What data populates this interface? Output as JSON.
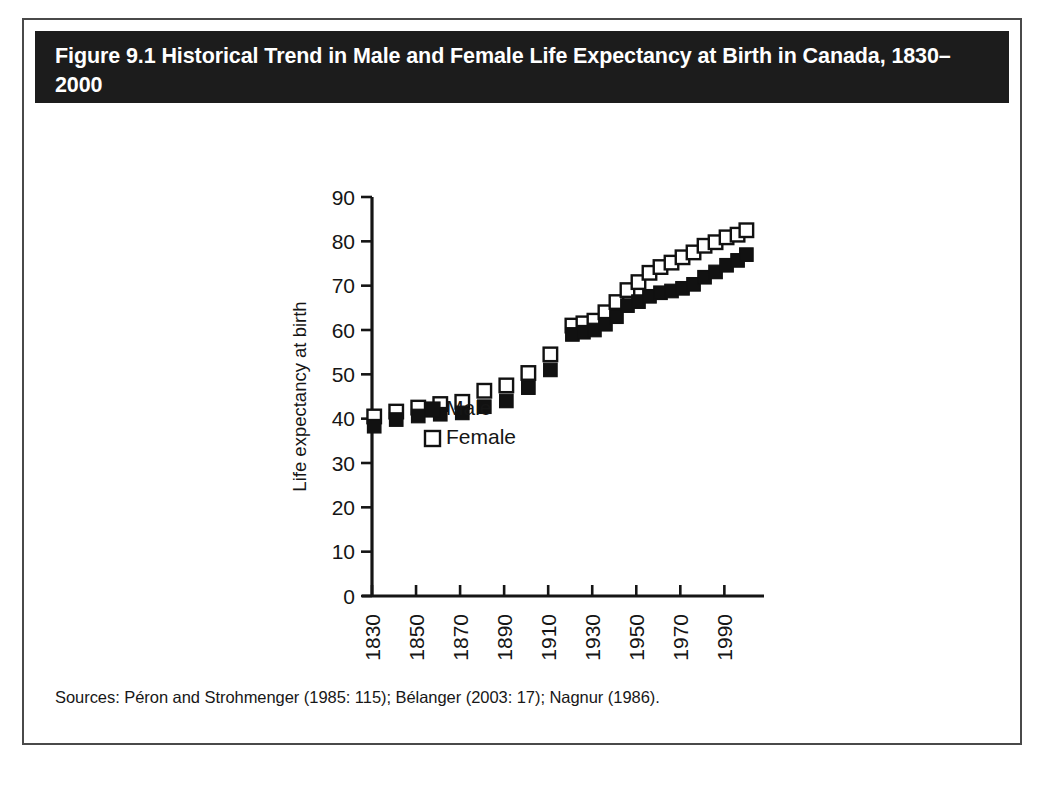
{
  "figure": {
    "title": "Figure 9.1 Historical Trend in Male and Female Life Expectancy at Birth in Canada, 1830–2000",
    "sources": "Sources: Péron and Strohmenger (1985: 115); Bélanger (2003: 17); Nagnur (1986).",
    "title_background": "#1c1c1c",
    "title_color": "#ffffff",
    "border_color": "#4a4a4a",
    "background": "#ffffff"
  },
  "chart_data": {
    "type": "scatter",
    "title": "Figure 9.1 Historical Trend in Male and Female Life Expectancy at Birth in Canada, 1830–2000",
    "xlabel": "",
    "ylabel": "Life expectancy at birth",
    "xlim": [
      1825,
      2005
    ],
    "ylim": [
      0,
      90
    ],
    "yticks": [
      0,
      10,
      20,
      30,
      40,
      50,
      60,
      70,
      80,
      90
    ],
    "xticks": [
      1830,
      1850,
      1870,
      1890,
      1910,
      1930,
      1950,
      1970,
      1990
    ],
    "xtick_rotation": 90,
    "grid": false,
    "legend_position": "inside-lower-left",
    "marker_male": "filled-square",
    "marker_female": "open-square",
    "color_male": "#111111",
    "color_female": "#ffffff",
    "series": [
      {
        "name": "Male",
        "x": [
          1831,
          1841,
          1851,
          1861,
          1871,
          1881,
          1891,
          1901,
          1911,
          1921,
          1926,
          1931,
          1936,
          1941,
          1946,
          1951,
          1956,
          1961,
          1966,
          1971,
          1976,
          1981,
          1986,
          1991,
          1996,
          2000
        ],
        "values": [
          38.3,
          39.8,
          40.6,
          41.0,
          41.3,
          42.7,
          44.0,
          47.0,
          51.0,
          59.0,
          59.5,
          60.0,
          61.3,
          63.0,
          65.5,
          66.4,
          67.6,
          68.4,
          68.8,
          69.4,
          70.3,
          71.9,
          73.1,
          74.6,
          75.7,
          77.0
        ]
      },
      {
        "name": "Female",
        "x": [
          1831,
          1841,
          1851,
          1861,
          1871,
          1881,
          1891,
          1901,
          1911,
          1921,
          1926,
          1931,
          1936,
          1941,
          1946,
          1951,
          1956,
          1961,
          1966,
          1971,
          1976,
          1981,
          1986,
          1991,
          1996,
          2000
        ],
        "values": [
          40.5,
          41.6,
          42.5,
          43.3,
          43.8,
          46.3,
          47.5,
          50.3,
          54.5,
          61.0,
          61.5,
          62.1,
          64.0,
          66.3,
          69.0,
          70.8,
          72.9,
          74.2,
          75.2,
          76.4,
          77.5,
          79.0,
          79.8,
          80.9,
          81.5,
          82.5
        ]
      }
    ],
    "legend": [
      {
        "label": "Male",
        "marker": "filled-square"
      },
      {
        "label": "Female",
        "marker": "open-square"
      }
    ]
  }
}
